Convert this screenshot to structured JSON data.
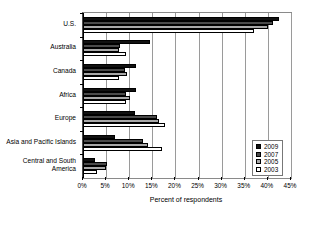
{
  "chart_data": {
    "type": "bar",
    "orientation": "horizontal",
    "title": "",
    "xlabel": "Percent of respondents",
    "ylabel": "",
    "xlim": [
      0,
      45
    ],
    "xtick_labels": [
      "0%",
      "5%",
      "10%",
      "15%",
      "20%",
      "25%",
      "30%",
      "35%",
      "40%",
      "45%"
    ],
    "xtick_values": [
      0,
      5,
      10,
      15,
      20,
      25,
      30,
      35,
      40,
      45
    ],
    "grid": true,
    "legend_position": "bottom-right",
    "categories": [
      "U.S.",
      "Australia",
      "Canada",
      "Africa",
      "Europe",
      "Asia and Pacific Islands",
      "Central and South America"
    ],
    "series": [
      {
        "name": "2009",
        "color": "#111111",
        "values": [
          42.5,
          14.5,
          11.5,
          11.5,
          11.2,
          7.0,
          2.5
        ]
      },
      {
        "name": "2007",
        "color": "#4a4a4a",
        "values": [
          41.0,
          8.0,
          9.0,
          9.2,
          16.0,
          13.0,
          5.2
        ]
      },
      {
        "name": "2005",
        "color": "#a8a8a8",
        "values": [
          40.0,
          7.8,
          9.5,
          10.2,
          16.5,
          14.0,
          5.0
        ]
      },
      {
        "name": "2003",
        "color": "#ffffff",
        "values": [
          37.0,
          9.3,
          7.8,
          9.2,
          17.8,
          17.0,
          3.0
        ]
      }
    ]
  },
  "legend": {
    "entries": [
      {
        "label": "2009"
      },
      {
        "label": "2007"
      },
      {
        "label": "2005"
      },
      {
        "label": "2003"
      }
    ]
  }
}
